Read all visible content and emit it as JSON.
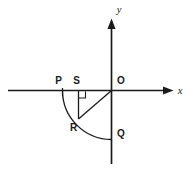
{
  "figure": {
    "background_color": "#ffffff",
    "stroke_color": "#1a1a1a",
    "axes": {
      "x_axis_label": "x",
      "y_axis_label": "y",
      "origin_label": "O"
    },
    "points": [
      {
        "id": "P",
        "label": "P",
        "description": "point on negative x-axis, arc start"
      },
      {
        "id": "S",
        "label": "S",
        "description": "foot of perpendicular on x-axis between P and O"
      },
      {
        "id": "O",
        "label": "O",
        "description": "origin"
      },
      {
        "id": "R",
        "label": "R",
        "description": "point on arc in third quadrant"
      },
      {
        "id": "Q",
        "label": "Q",
        "description": "point on negative y-axis, arc end"
      }
    ],
    "segments": [
      {
        "id": "SR",
        "from": "S",
        "to": "R",
        "description": "vertical segment from S down to R"
      },
      {
        "id": "OR",
        "from": "O",
        "to": "R",
        "description": "radius from origin to R"
      }
    ],
    "arc": {
      "id": "PRQ",
      "from": "P",
      "through": "R",
      "to": "Q",
      "description": "quarter circle arc centred at O through third quadrant"
    },
    "right_angle": {
      "at": "S",
      "description": "right angle mark between SR and the x-axis"
    }
  }
}
